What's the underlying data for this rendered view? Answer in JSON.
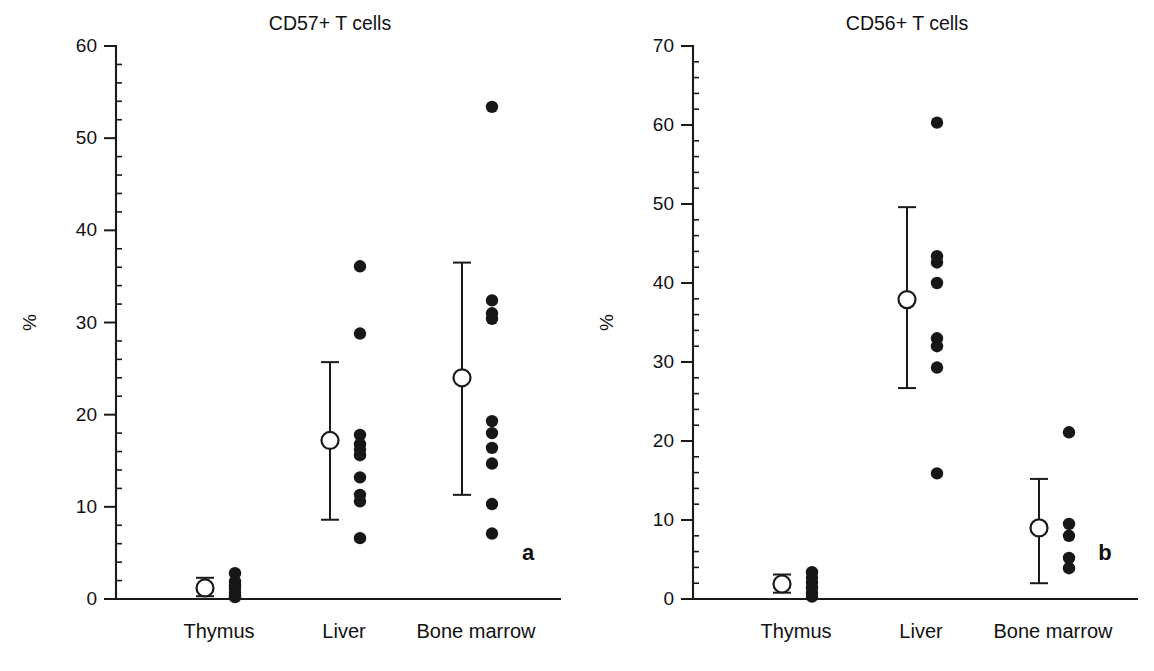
{
  "figure": {
    "title": "",
    "background": "#ffffff",
    "dot_color": "#171717",
    "axis_color": "#1a1a1a",
    "marker_fill": "#ffffff"
  },
  "chart_data": [
    {
      "type": "scatter",
      "panel_letter": "a",
      "title": "CD57+ T cells",
      "xlabel": "",
      "ylabel": "%",
      "ylim": [
        0,
        60
      ],
      "yticks": [
        0,
        10,
        20,
        30,
        40,
        50,
        60
      ],
      "ytick_labels": [
        "0",
        "10",
        "20",
        "30",
        "40",
        "50",
        "60"
      ],
      "yminor_step": 2,
      "grid": false,
      "legend": "none",
      "categories": [
        "Thymus",
        "Liver",
        "Bone marrow"
      ],
      "groups": [
        {
          "name": "Thymus",
          "points": [
            0.2,
            0.4,
            0.7,
            1.1,
            1.5,
            1.9,
            2.8
          ],
          "mean": 1.2,
          "error_low": 0.3,
          "error_high": 2.3
        },
        {
          "name": "Liver",
          "points": [
            6.6,
            10.6,
            11.3,
            13.2,
            15.6,
            16.2,
            16.8,
            17.8,
            28.8,
            36.1
          ],
          "mean": 17.2,
          "error_low": 8.6,
          "error_high": 25.7
        },
        {
          "name": "Bone marrow",
          "points": [
            7.1,
            10.3,
            14.7,
            16.4,
            18.0,
            19.3,
            30.4,
            31.0,
            32.4,
            53.4
          ],
          "mean": 24.0,
          "error_low": 11.3,
          "error_high": 36.5
        }
      ]
    },
    {
      "type": "scatter",
      "panel_letter": "b",
      "title": "CD56+ T cells",
      "xlabel": "",
      "ylabel": "%",
      "ylim": [
        0,
        70
      ],
      "yticks": [
        0,
        10,
        20,
        30,
        40,
        50,
        60,
        70
      ],
      "ytick_labels": [
        "0",
        "10",
        "20",
        "30",
        "40",
        "50",
        "60",
        "70"
      ],
      "yminor_step": 2,
      "grid": false,
      "legend": "none",
      "categories": [
        "Thymus",
        "Liver",
        "Bone marrow"
      ],
      "groups": [
        {
          "name": "Thymus",
          "points": [
            0.3,
            0.8,
            1.4,
            2.1,
            2.7,
            3.4
          ],
          "mean": 1.9,
          "error_low": 0.8,
          "error_high": 3.1
        },
        {
          "name": "Liver",
          "points": [
            15.9,
            29.3,
            32.0,
            33.0,
            40.0,
            42.6,
            43.4,
            60.3
          ],
          "mean": 37.9,
          "error_low": 26.7,
          "error_high": 49.6
        },
        {
          "name": "Bone marrow",
          "points": [
            3.9,
            5.2,
            8.0,
            9.5,
            21.1
          ],
          "mean": 9.0,
          "error_low": 2.0,
          "error_high": 15.2
        }
      ]
    }
  ]
}
